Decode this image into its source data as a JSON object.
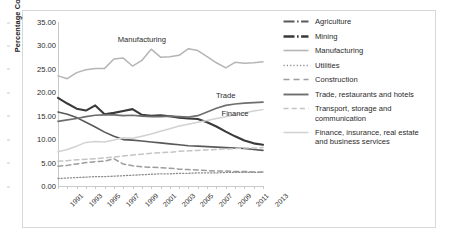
{
  "chart_data": {
    "type": "line",
    "title": "",
    "xlabel": "",
    "ylabel": "Percentage Contribution",
    "ylim": [
      0,
      35
    ],
    "ytick_labels": [
      "0.00",
      "5.00",
      "10.00",
      "15.00",
      "20.00",
      "25.00",
      "30.00",
      "35.00"
    ],
    "ytick_values": [
      0,
      5,
      10,
      15,
      20,
      25,
      30,
      35
    ],
    "grid": false,
    "legend_position": "right",
    "x": [
      1991,
      1992,
      1993,
      1994,
      1995,
      1996,
      1997,
      1998,
      1999,
      2000,
      2001,
      2002,
      2003,
      2004,
      2005,
      2006,
      2007,
      2008,
      2009,
      2010,
      2011,
      2012,
      2013
    ],
    "xtick_labels": [
      "1991",
      "1993",
      "1995",
      "1997",
      "1999",
      "2001",
      "2003",
      "2005",
      "2007",
      "2009",
      "2011",
      "2013"
    ],
    "xtick_values": [
      1991,
      1993,
      1995,
      1997,
      1999,
      2001,
      2003,
      2005,
      2007,
      2009,
      2011,
      2013
    ],
    "annotations": [
      {
        "text": "Manufacturing",
        "x": 2000,
        "y": 31.3
      },
      {
        "text": "Trade",
        "x": 2009,
        "y": 19.4
      },
      {
        "text": "Finance",
        "x": 2010,
        "y": 15.6
      }
    ],
    "series": [
      {
        "name": "Agriculture",
        "color": "#595959",
        "style": "solid",
        "width": 1.6,
        "values": [
          15.8,
          15.3,
          14.6,
          13.6,
          12.6,
          11.5,
          10.6,
          9.9,
          9.8,
          9.6,
          9.4,
          9.2,
          9.0,
          8.8,
          8.6,
          8.5,
          8.4,
          8.3,
          8.2,
          8.1,
          8.0,
          7.8,
          7.6
        ]
      },
      {
        "name": "Mining",
        "color": "#3a3a3a",
        "style": "solid",
        "width": 2.1,
        "values": [
          18.8,
          17.6,
          16.5,
          16.1,
          17.2,
          15.3,
          15.6,
          16.0,
          16.4,
          15.2,
          15.0,
          15.1,
          14.9,
          14.6,
          14.4,
          14.3,
          13.6,
          12.7,
          11.6,
          10.6,
          9.7,
          9.1,
          8.8
        ]
      },
      {
        "name": "Manufacturing",
        "color": "#b5b5b5",
        "style": "solid",
        "width": 1.5,
        "values": [
          23.5,
          22.9,
          24.2,
          24.8,
          25.1,
          25.1,
          27.1,
          27.3,
          25.6,
          26.8,
          29.2,
          27.5,
          27.6,
          27.9,
          29.3,
          28.9,
          27.6,
          26.3,
          25.2,
          26.4,
          26.2,
          26.3,
          26.5
        ]
      },
      {
        "name": "Utilities",
        "color": "#8c8c8c",
        "style": "dotted",
        "width": 1.3,
        "values": [
          1.6,
          1.7,
          1.8,
          1.9,
          2.0,
          2.0,
          2.1,
          2.2,
          2.3,
          2.4,
          2.5,
          2.6,
          2.6,
          2.7,
          2.7,
          2.8,
          2.8,
          2.8,
          2.9,
          2.9,
          2.9,
          2.9,
          2.9
        ]
      },
      {
        "name": "Construction",
        "color": "#9d9d9d",
        "style": "dashed",
        "width": 1.5,
        "values": [
          4.2,
          4.4,
          4.7,
          5.0,
          5.2,
          5.3,
          5.8,
          4.7,
          4.3,
          4.1,
          4.0,
          3.9,
          3.8,
          3.6,
          3.5,
          3.4,
          3.3,
          3.2,
          3.2,
          3.1,
          3.1,
          3.0,
          3.0
        ]
      },
      {
        "name": "Trade, restaurants and hotels",
        "color": "#6e6e6e",
        "style": "solid",
        "width": 1.7,
        "values": [
          13.8,
          14.1,
          14.4,
          14.8,
          15.1,
          15.2,
          15.2,
          15.0,
          15.1,
          14.9,
          14.8,
          14.8,
          14.9,
          14.8,
          14.7,
          15.0,
          15.8,
          16.6,
          17.2,
          17.5,
          17.7,
          17.8,
          17.9
        ]
      },
      {
        "name": "Transport, storage and\ncommunication",
        "color": "#c4c4c4",
        "style": "dashed",
        "width": 1.5,
        "values": [
          5.3,
          5.4,
          5.6,
          5.7,
          5.8,
          6.0,
          6.2,
          6.4,
          6.6,
          6.8,
          7.0,
          7.1,
          7.2,
          7.4,
          7.5,
          7.6,
          7.7,
          7.8,
          7.9,
          8.0,
          8.1,
          8.1,
          8.2
        ]
      },
      {
        "name": "Finance, insurance, real estate\nand business services",
        "color": "#d2d2d2",
        "style": "solid",
        "width": 1.5,
        "values": [
          7.3,
          7.8,
          8.5,
          9.3,
          9.5,
          9.4,
          9.8,
          10.3,
          10.2,
          10.6,
          11.1,
          11.7,
          12.2,
          12.8,
          13.2,
          13.6,
          14.0,
          14.4,
          14.8,
          15.2,
          15.6,
          16.0,
          16.3
        ]
      }
    ]
  },
  "legend": {
    "items": [
      {
        "label": "Agriculture",
        "swatch": "dashdot-dark-thin"
      },
      {
        "label": "Mining",
        "swatch": "dashdot-dark-thick"
      },
      {
        "label": "Manufacturing",
        "swatch": "solid-light"
      },
      {
        "label": "Utilities",
        "swatch": "dotted-gray"
      },
      {
        "label": "Construction",
        "swatch": "dashed-gray"
      },
      {
        "label": "Trade, restaurants and hotels",
        "swatch": "solid-dark"
      },
      {
        "label": "Transport, storage and\ncommunication",
        "swatch": "dashed-light"
      },
      {
        "label": "Finance, insurance, real estate\nand business services",
        "swatch": "solid-pale"
      }
    ]
  }
}
